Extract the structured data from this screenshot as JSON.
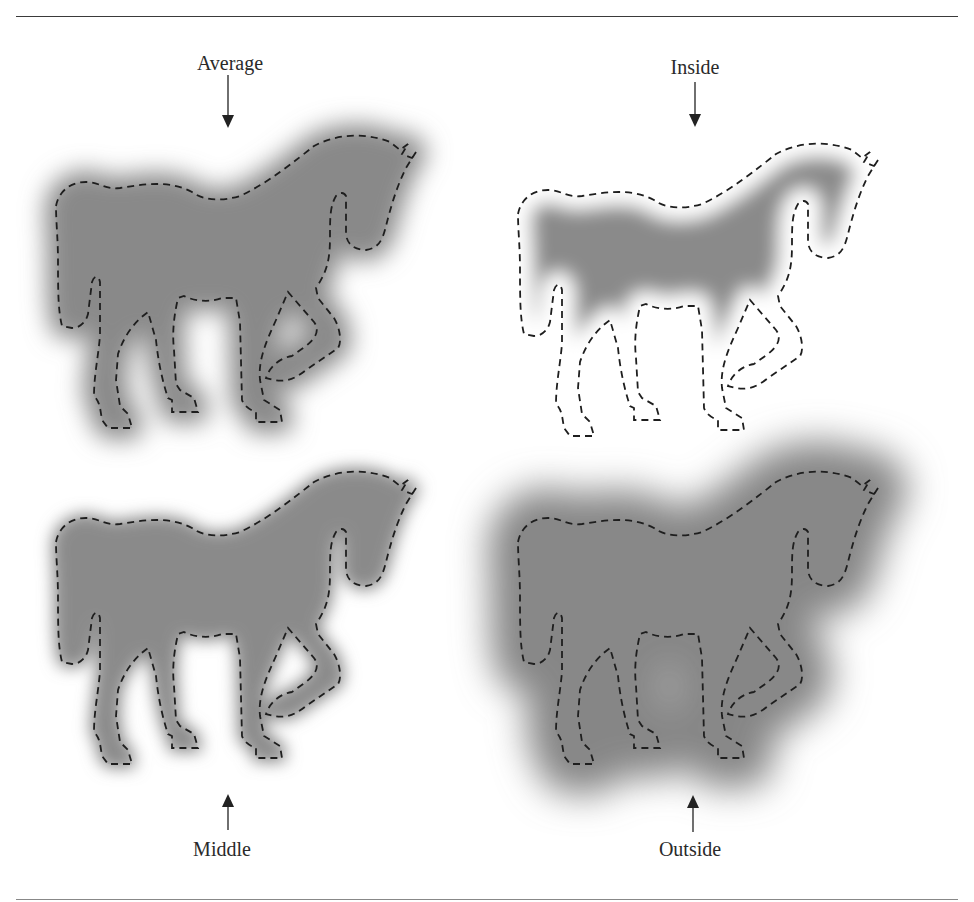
{
  "figure": {
    "panels": [
      {
        "id": "average",
        "label": "Average",
        "arrow": "down",
        "position": "top-left"
      },
      {
        "id": "inside",
        "label": "Inside",
        "arrow": "down",
        "position": "top-right"
      },
      {
        "id": "middle",
        "label": "Middle",
        "arrow": "up",
        "position": "bottom-left"
      },
      {
        "id": "outside",
        "label": "Outside",
        "arrow": "up",
        "position": "bottom-right"
      }
    ],
    "colors": {
      "fill": "#8a8a8a",
      "outline": "#1e1e1e",
      "rule": "#3a3a3a",
      "background": "#ffffff"
    }
  }
}
